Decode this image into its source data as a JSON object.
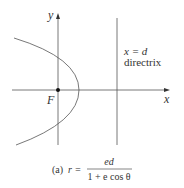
{
  "figure": {
    "axis_x_label": "x",
    "axis_y_label": "y",
    "focus_label": "F",
    "directrix_eq": "x = d",
    "directrix_label": "directrix",
    "caption_prefix": "(a)",
    "caption_lhs": "r =",
    "caption_num": "ed",
    "caption_den": "1 + e cos θ"
  },
  "colors": {
    "line": "#555555",
    "text": "#333333"
  }
}
